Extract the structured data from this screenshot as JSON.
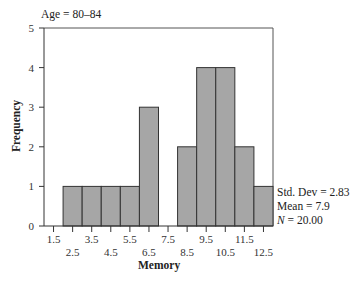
{
  "chart_data": {
    "type": "bar",
    "subtype": "histogram",
    "title": "Age = 80–84",
    "xlabel": "Memory",
    "ylabel": "Frequency",
    "categories": [
      "2.5",
      "3.5",
      "4.5",
      "5.5",
      "6.5",
      "7.5",
      "8.5",
      "9.5",
      "10.5",
      "11.5",
      "12.5"
    ],
    "bin_width": 1.0,
    "values": [
      1,
      1,
      1,
      1,
      3,
      0,
      2,
      4,
      4,
      2,
      1
    ],
    "x_ticks": [
      "1.5",
      "2.5",
      "3.5",
      "4.5",
      "5.5",
      "6.5",
      "7.5",
      "8.5",
      "9.5",
      "10.5",
      "11.5",
      "12.5"
    ],
    "y_ticks": [
      "0",
      "1",
      "2",
      "3",
      "4",
      "5"
    ],
    "ylim": [
      0,
      5
    ],
    "xlim": [
      1.0,
      13.0
    ],
    "grid": false,
    "bar_color": "#a6a6a6",
    "bar_edge_color": "#333333",
    "statistics": {
      "std_dev": "Std. Dev = 2.83",
      "mean": "Mean = 7.9",
      "n_prefix": "N",
      "n_value": " = 20.00"
    }
  }
}
